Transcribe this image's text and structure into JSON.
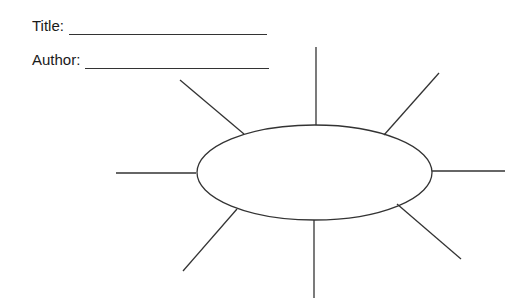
{
  "worksheet": {
    "title_label": "Title:",
    "title_value": "",
    "author_label": "Author:",
    "author_value": ""
  },
  "graphic_organizer": {
    "type": "web / spider map",
    "center_oval": {
      "label": ""
    },
    "spokes": [
      {
        "id": "top",
        "text": ""
      },
      {
        "id": "top-right",
        "text": ""
      },
      {
        "id": "right",
        "text": ""
      },
      {
        "id": "bottom-right",
        "text": ""
      },
      {
        "id": "bottom",
        "text": ""
      },
      {
        "id": "bottom-left",
        "text": ""
      },
      {
        "id": "left",
        "text": ""
      },
      {
        "id": "top-left",
        "text": ""
      }
    ],
    "stroke_color": "#333333"
  }
}
